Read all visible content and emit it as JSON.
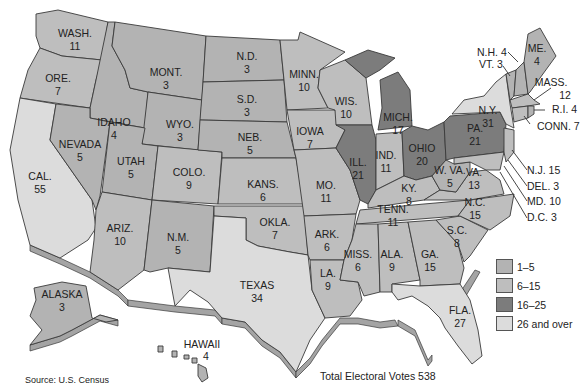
{
  "title": "Total Electoral Votes 538",
  "source": "Source: U.S. Census",
  "legend": [
    {
      "label": "1–5",
      "color": "#b3b3b3"
    },
    {
      "label": "6–15",
      "color": "#bebebe"
    },
    {
      "label": "16–25",
      "color": "#7c7c7c"
    },
    {
      "label": "26 and over",
      "color": "#dcdcdc"
    }
  ],
  "states": {
    "wa": {
      "name": "WASH.",
      "votes": "11"
    },
    "or": {
      "name": "ORE.",
      "votes": "7"
    },
    "ca": {
      "name": "CAL.",
      "votes": "55"
    },
    "id": {
      "name": "IDAHO",
      "votes": "4"
    },
    "nv": {
      "name": "NEVADA",
      "votes": "5"
    },
    "mt": {
      "name": "MONT.",
      "votes": "3"
    },
    "wy": {
      "name": "WYO.",
      "votes": "3"
    },
    "ut": {
      "name": "UTAH",
      "votes": "5"
    },
    "co": {
      "name": "COLO.",
      "votes": "9"
    },
    "az": {
      "name": "ARIZ.",
      "votes": "10"
    },
    "nm": {
      "name": "N.M.",
      "votes": "5"
    },
    "nd": {
      "name": "N.D.",
      "votes": "3"
    },
    "sd": {
      "name": "S.D.",
      "votes": "3"
    },
    "ne": {
      "name": "NEB.",
      "votes": "5"
    },
    "ks": {
      "name": "KANS.",
      "votes": "6"
    },
    "ok": {
      "name": "OKLA.",
      "votes": "7"
    },
    "tx": {
      "name": "TEXAS",
      "votes": "34"
    },
    "mn": {
      "name": "MINN.",
      "votes": "10"
    },
    "ia": {
      "name": "IOWA",
      "votes": "7"
    },
    "mo": {
      "name": "MO.",
      "votes": "11"
    },
    "ar": {
      "name": "ARK.",
      "votes": "6"
    },
    "la": {
      "name": "LA.",
      "votes": "9"
    },
    "wi": {
      "name": "WIS.",
      "votes": "10"
    },
    "il": {
      "name": "ILL.",
      "votes": "21"
    },
    "mi": {
      "name": "MICH.",
      "votes": "17"
    },
    "in": {
      "name": "IND.",
      "votes": "11"
    },
    "oh": {
      "name": "OHIO",
      "votes": "20"
    },
    "ky": {
      "name": "KY.",
      "votes": "8"
    },
    "tn": {
      "name": "TENN.",
      "votes": "11"
    },
    "ms": {
      "name": "MISS.",
      "votes": "6"
    },
    "al": {
      "name": "ALA.",
      "votes": "9"
    },
    "ga": {
      "name": "GA.",
      "votes": "15"
    },
    "fl": {
      "name": "FLA.",
      "votes": "27"
    },
    "sc": {
      "name": "S.C.",
      "votes": "8"
    },
    "nc": {
      "name": "N.C.",
      "votes": "15"
    },
    "va": {
      "name": "VA.",
      "votes": "13"
    },
    "wv": {
      "name": "W. VA.",
      "votes": "5"
    },
    "pa": {
      "name": "PA.",
      "votes": "21"
    },
    "ny": {
      "name": "N.Y.",
      "votes": "31"
    },
    "me": {
      "name": "ME.",
      "votes": "4"
    },
    "ak": {
      "name": "ALASKA",
      "votes": "3"
    },
    "hi": {
      "name": "HAWAII",
      "votes": "4"
    }
  },
  "callouts": {
    "nh": "N.H. 4",
    "vt": "VT. 3",
    "ma_name": "MASS.",
    "ma_votes": "12",
    "ri": "R.I. 4",
    "ct": "CONN. 7",
    "nj": "N.J. 15",
    "de": "DEL. 3",
    "md": "MD. 10",
    "dc": "D.C. 3"
  }
}
